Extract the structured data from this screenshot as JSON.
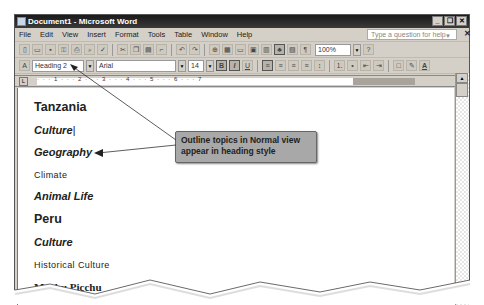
{
  "window": {
    "title": "Document1 - Microsoft Word",
    "controls": [
      "_",
      "❐",
      "✕"
    ]
  },
  "menubar": {
    "items": [
      "File",
      "Edit",
      "View",
      "Insert",
      "Format",
      "Tools",
      "Table",
      "Window",
      "Help"
    ],
    "help_placeholder": "Type a question for help",
    "help_close": "✕"
  },
  "standard_toolbar": {
    "icons": [
      "new-icon",
      "open-icon",
      "save-icon",
      "permission-icon",
      "print-icon",
      "print-preview-icon",
      "spelling-icon",
      "cut-icon",
      "copy-icon",
      "paste-icon",
      "format-painter-icon",
      "undo-icon",
      "redo-icon",
      "hyperlink-icon",
      "tables-borders-icon",
      "insert-table-icon",
      "insert-excel-icon",
      "columns-icon",
      "drawing-icon",
      "document-map-icon",
      "show-hide-icon"
    ],
    "zoom": "100%"
  },
  "formatting_toolbar": {
    "style": "Heading 2",
    "font": "Arial",
    "size": "14",
    "bold": "B",
    "italic": "I",
    "underline": "U"
  },
  "ruler": {
    "numbers": "· · · 1 · · · 2 · · · 3 · · · 4 · · · 5 · · · 6 · · · 7"
  },
  "document": {
    "lines": [
      {
        "text": "Tanzania",
        "style": "h1"
      },
      {
        "text": "Culture",
        "style": "h2"
      },
      {
        "text": "Geography",
        "style": "h2"
      },
      {
        "text": "Climate",
        "style": "h3"
      },
      {
        "text": "Animal Life",
        "style": "h2"
      },
      {
        "text": "Peru",
        "style": "h1"
      },
      {
        "text": "Culture",
        "style": "h2"
      },
      {
        "text": "Historical Culture",
        "style": "h3"
      },
      {
        "text": "Machu Picchu",
        "style": "h4"
      }
    ]
  },
  "callout": {
    "text": "Outline topics in Normal view appear in heading style"
  },
  "colors": {
    "titlebar": "#222222",
    "callout_bg": "#a8a8a8",
    "chrome": "#d4d0c8"
  }
}
